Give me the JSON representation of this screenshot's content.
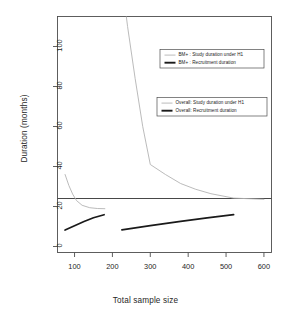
{
  "figure": {
    "background": "#ffffff",
    "frame_color": "#4d4d4d",
    "width": 291,
    "height": 320
  },
  "chart_data": {
    "type": "line",
    "title": "",
    "xlabel": "Total sample size",
    "ylabel": "Duration (months)",
    "xlim": [
      55,
      620
    ],
    "ylim": [
      -3,
      115
    ],
    "xticks": [
      100,
      200,
      300,
      400,
      500,
      600
    ],
    "yticks": [
      0,
      20,
      40,
      60,
      80,
      100
    ],
    "grid": false,
    "legend_position": "upper-right",
    "reference_line": {
      "orientation": "horizontal",
      "y": 24,
      "color": "#333333",
      "label": "maximum acceptable duration"
    },
    "series": [
      {
        "name": "BM+ : Study duration under H1",
        "color": "#b3b3b3",
        "width": 0.9,
        "style": "solid",
        "x": [
          75,
          85,
          95,
          105,
          120,
          140,
          160,
          180
        ],
        "y": [
          36.0,
          30.5,
          26.2,
          23.0,
          20.6,
          19.4,
          19.0,
          18.9
        ]
      },
      {
        "name": "BM+ : Recruitment duration",
        "color": "#1a1a1a",
        "width": 1.7,
        "style": "solid",
        "x": [
          75,
          100,
          125,
          150,
          178
        ],
        "y": [
          8.2,
          10.4,
          12.5,
          14.4,
          15.9
        ]
      },
      {
        "name": "Overall: Study duration under H1",
        "color": "#b3b3b3",
        "width": 0.9,
        "style": "solid",
        "x": [
          225,
          240,
          260,
          280,
          300,
          340,
          380,
          420,
          460,
          520,
          600
        ],
        "y": [
          133.0,
          110.0,
          84.0,
          60.0,
          41.0,
          36.0,
          31.5,
          28.6,
          26.4,
          24.2,
          23.6
        ]
      },
      {
        "name": "Overall: Recruitment duration",
        "color": "#1a1a1a",
        "width": 1.7,
        "style": "solid",
        "x": [
          225,
          300,
          380,
          450,
          520
        ],
        "y": [
          8.3,
          10.4,
          12.6,
          14.3,
          15.9
        ]
      }
    ]
  },
  "legends": [
    {
      "id": "legend-bm-plus",
      "entries": [
        {
          "label": "BM+ : Study duration under H1",
          "color": "#b3b3b3",
          "weight": "thin"
        },
        {
          "label": "BM+ : Recruitment duration",
          "color": "#1a1a1a",
          "weight": "thick"
        }
      ]
    },
    {
      "id": "legend-overall",
      "entries": [
        {
          "label": "Overall: Study duration under H1",
          "color": "#b3b3b3",
          "weight": "thin"
        },
        {
          "label": "Overall: Recruitment duration",
          "color": "#1a1a1a",
          "weight": "thick"
        }
      ]
    }
  ]
}
